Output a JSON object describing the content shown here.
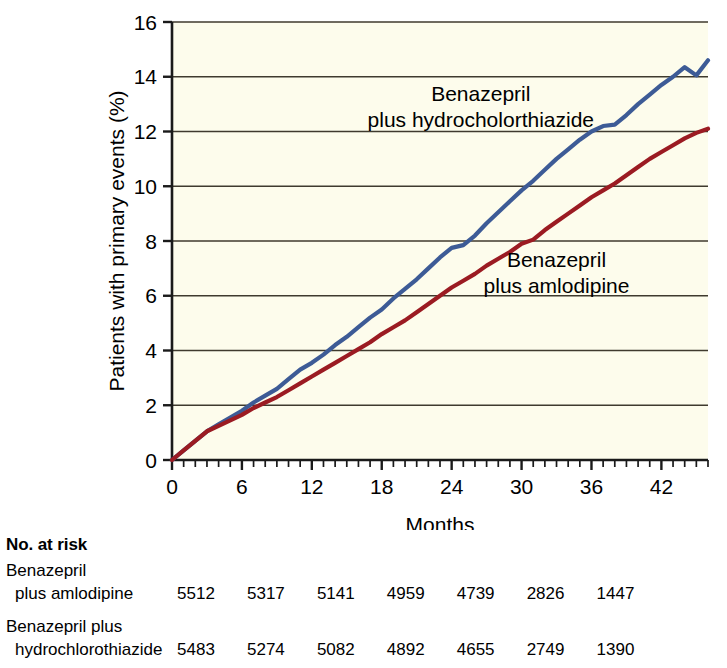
{
  "chart_data": {
    "type": "line",
    "title": "",
    "xlabel": "Months",
    "ylabel": "Patients with primary events (%)",
    "xlim": [
      0,
      46
    ],
    "ylim": [
      0,
      16
    ],
    "xticks": [
      0,
      6,
      12,
      18,
      24,
      30,
      36,
      42
    ],
    "xtick_labels": [
      "0",
      "6",
      "12",
      "18",
      "24",
      "30",
      "36",
      "42"
    ],
    "yticks": [
      0,
      2,
      4,
      6,
      8,
      10,
      12,
      14,
      16
    ],
    "ytick_labels": [
      "0",
      "2",
      "4",
      "6",
      "8",
      "10",
      "12",
      "14",
      "16"
    ],
    "minor_x_tick_step": 1,
    "grid": "horizontal",
    "legend_position": "inline-annotation",
    "plot_background": "#fdfcec",
    "series": [
      {
        "name": "Benazepril plus hydrocholorthiazide",
        "color": "#3d5b96",
        "annotation_lines": [
          "Benazepril",
          "plus hydrocholorthiazide"
        ],
        "annotation_x": 26.5,
        "annotation_y": 13.1,
        "x": [
          0,
          1,
          2,
          3,
          4,
          5,
          6,
          7,
          8,
          9,
          10,
          11,
          12,
          13,
          14,
          15,
          16,
          17,
          18,
          19,
          20,
          21,
          22,
          23,
          24,
          25,
          26,
          27,
          28,
          29,
          30,
          31,
          32,
          33,
          34,
          35,
          36,
          37,
          38,
          39,
          40,
          41,
          42,
          43,
          44,
          45,
          46
        ],
        "y": [
          0.0,
          0.35,
          0.7,
          1.05,
          1.3,
          1.55,
          1.8,
          2.1,
          2.35,
          2.6,
          2.95,
          3.3,
          3.55,
          3.85,
          4.2,
          4.5,
          4.85,
          5.2,
          5.5,
          5.9,
          6.25,
          6.6,
          7.0,
          7.4,
          7.75,
          7.85,
          8.2,
          8.65,
          9.05,
          9.45,
          9.85,
          10.2,
          10.6,
          11.0,
          11.35,
          11.7,
          12.0,
          12.2,
          12.25,
          12.6,
          13.0,
          13.35,
          13.7,
          14.0,
          14.35,
          14.05,
          14.6
        ]
      },
      {
        "name": "Benazepril plus amlodipine",
        "color": "#9b1b22",
        "annotation_lines": [
          "Benazepril",
          "plus amlodipine"
        ],
        "annotation_x": 33.0,
        "annotation_y": 7.05,
        "x": [
          0,
          1,
          2,
          3,
          4,
          5,
          6,
          7,
          8,
          9,
          10,
          11,
          12,
          13,
          14,
          15,
          16,
          17,
          18,
          19,
          20,
          21,
          22,
          23,
          24,
          25,
          26,
          27,
          28,
          29,
          30,
          31,
          32,
          33,
          34,
          35,
          36,
          37,
          38,
          39,
          40,
          41,
          42,
          43,
          44,
          45,
          46
        ],
        "y": [
          0.0,
          0.35,
          0.7,
          1.05,
          1.25,
          1.45,
          1.65,
          1.9,
          2.1,
          2.3,
          2.55,
          2.8,
          3.05,
          3.3,
          3.55,
          3.8,
          4.05,
          4.3,
          4.6,
          4.85,
          5.1,
          5.4,
          5.7,
          6.0,
          6.3,
          6.55,
          6.8,
          7.1,
          7.35,
          7.6,
          7.9,
          8.05,
          8.4,
          8.7,
          9.0,
          9.3,
          9.6,
          9.85,
          10.1,
          10.4,
          10.7,
          11.0,
          11.25,
          11.5,
          11.75,
          11.95,
          12.1
        ]
      }
    ]
  },
  "risk_table": {
    "title": "No. at risk",
    "rows": [
      {
        "label_line1": "Benazepril",
        "label_line2": "plus amlodipine",
        "values": [
          "5512",
          "5317",
          "5141",
          "4959",
          "4739",
          "2826",
          "1447"
        ]
      },
      {
        "label_line1": "Benazepril plus",
        "label_line2": "hydrochlorothiazide",
        "values": [
          "5483",
          "5274",
          "5082",
          "4892",
          "4655",
          "2749",
          "1390"
        ]
      }
    ]
  }
}
